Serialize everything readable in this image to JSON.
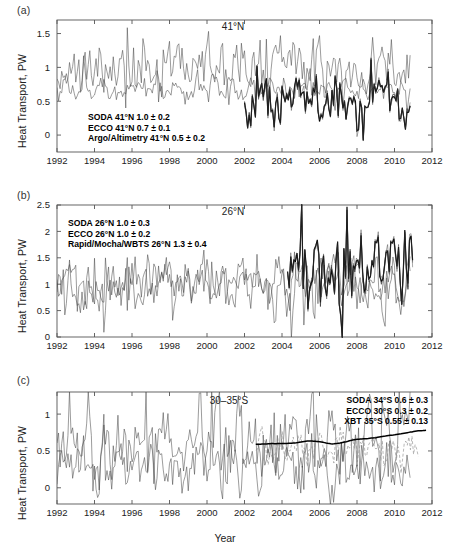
{
  "figure": {
    "xlabel": "Year",
    "ylabel": "Heat Transport, PW"
  },
  "panels": [
    {
      "id": "a",
      "label": "(a)",
      "title": "41°N",
      "legend": [
        "SODA 41°N 1.0 ± 0.2",
        "ECCO 41°N 0.7 ± 0.1",
        "Argo/Altimetry  41°N  0.5 ± 0.2"
      ],
      "yticks": [
        "0",
        "0.5",
        "1",
        "1.5"
      ]
    },
    {
      "id": "b",
      "label": "(b)",
      "title": "26°N",
      "legend": [
        "SODA 26°N 1.0 ± 0.3",
        "ECCO 26°N 1.0 ± 0.2",
        "Rapid/Mocha/WBTS 26°N 1.3 ± 0.4"
      ],
      "yticks": [
        "0",
        "0.5",
        "1",
        "1.5",
        "2",
        "2.5"
      ]
    },
    {
      "id": "c",
      "label": "(c)",
      "title": "30–35°S",
      "legend": [
        "SODA 34°S  0.6 ± 0.3",
        "ECCO 30°S  0.3 ± 0.2",
        "XBT 35°S  0.55 ± 0.13"
      ],
      "yticks": [
        "0",
        "0.5",
        "1"
      ]
    }
  ],
  "xticks": [
    "1992",
    "1994",
    "1996",
    "1998",
    "2000",
    "2002",
    "2004",
    "2006",
    "2008",
    "2010",
    "2012"
  ],
  "chart_data": {
    "type": "line",
    "xlabel": "Year",
    "ylabel": "Heat Transport, PW",
    "xlim": [
      1992,
      2012
    ],
    "grid": false,
    "legend_position": "inside",
    "panels": [
      {
        "panel": "a",
        "annotation": "41°N",
        "ylim": [
          -0.25,
          1.7
        ],
        "yticks": [
          0,
          0.5,
          1,
          1.5
        ],
        "series": [
          {
            "name": "SODA 41°N",
            "mean": 1.0,
            "std": 0.2,
            "style": "thin",
            "x_start": 1992.0,
            "x_end": 2010.9
          },
          {
            "name": "ECCO 41°N",
            "mean": 0.7,
            "std": 0.1,
            "style": "thin",
            "x_start": 1992.0,
            "x_end": 2010.9
          },
          {
            "name": "Argo/Altimetry 41°N",
            "mean": 0.5,
            "std": 0.2,
            "style": "thick",
            "x_start": 2002.0,
            "x_end": 2010.9
          }
        ]
      },
      {
        "panel": "b",
        "annotation": "26°N",
        "ylim": [
          0,
          2.5
        ],
        "yticks": [
          0,
          0.5,
          1,
          1.5,
          2,
          2.5
        ],
        "series": [
          {
            "name": "SODA 26°N",
            "mean": 1.0,
            "std": 0.3,
            "style": "thin",
            "x_start": 1992.0,
            "x_end": 2010.9
          },
          {
            "name": "ECCO 26°N",
            "mean": 1.0,
            "std": 0.2,
            "style": "thin",
            "x_start": 1992.0,
            "x_end": 2010.9
          },
          {
            "name": "Rapid/Mocha/WBTS 26°N",
            "mean": 1.3,
            "std": 0.4,
            "style": "thick",
            "x_start": 2004.3,
            "x_end": 2011.0
          }
        ]
      },
      {
        "panel": "c",
        "annotation": "30–35°S",
        "ylim": [
          -0.22,
          1.3
        ],
        "yticks": [
          0,
          0.5,
          1
        ],
        "series": [
          {
            "name": "SODA 34°S",
            "mean": 0.6,
            "std": 0.3,
            "style": "thin",
            "x_start": 1992.0,
            "x_end": 2010.9
          },
          {
            "name": "ECCO 30°S",
            "mean": 0.3,
            "std": 0.2,
            "style": "thin",
            "x_start": 1992.0,
            "x_end": 2010.9
          },
          {
            "name": "XBT 35°S",
            "mean": 0.55,
            "std": 0.13,
            "style": "dashed",
            "x_start": 2002.6,
            "x_end": 2011.3
          },
          {
            "name": "XBT 35°S smoothed",
            "mean": 0.55,
            "std": 0.08,
            "style": "smooth",
            "x_start": 2002.6,
            "x_end": 2011.7
          }
        ]
      }
    ]
  }
}
